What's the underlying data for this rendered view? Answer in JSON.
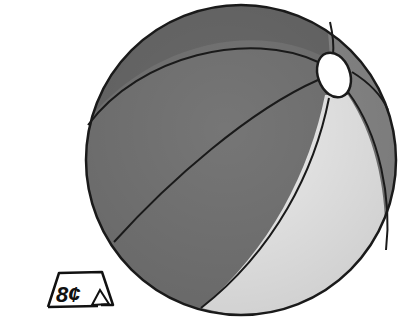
{
  "illustration": {
    "subject": "beach ball",
    "colors": {
      "dark_panel": "#6e6e6e",
      "mid_panel": "#7c7c7c",
      "light_panel": "#ececec",
      "right_band": "#8a8a8a",
      "cap": "#ffffff",
      "outline": "#1a1a1a"
    }
  },
  "price_tag": {
    "label": "8¢"
  }
}
